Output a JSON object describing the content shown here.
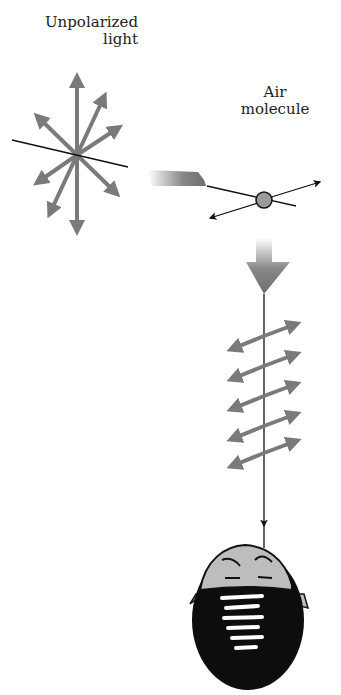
{
  "labels": {
    "unpolarized_line1": "Unpolarized",
    "unpolarized_line2": "light",
    "air_line1": "Air",
    "air_line2": "molecule"
  },
  "colors": {
    "arrow_gray": "#7a7a7a",
    "line_black": "#111111",
    "molecule_fill": "#9a9a9a",
    "head_hair": "#0d0d0d",
    "head_skin": "#bdbdbd"
  },
  "diagram": {
    "source": "unpolarized light (arrows in all directions)",
    "scatterer": "air molecule",
    "observer": "head viewed from above",
    "scattered_polarization_arrows": 5
  }
}
